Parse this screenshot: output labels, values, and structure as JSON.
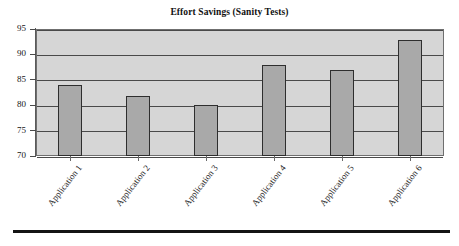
{
  "figure": {
    "background_color": "#ffffff",
    "plot_background_color": "#d6d6d6",
    "bar_color": "#a9a9a9",
    "bar_border_color": "#2e2e2e",
    "gridline_color": "#4a4a4a",
    "axis_color": "#5a5a5a",
    "rule_color": "#141414"
  },
  "chart_data": {
    "type": "bar",
    "title": "Effort Savings (Sanity Tests)",
    "xlabel": "",
    "ylabel": "",
    "categories": [
      "Application 1",
      "Application 2",
      "Application 3",
      "Application 4",
      "Application 5",
      "Application 6"
    ],
    "values": [
      84,
      81.8,
      80,
      88,
      87,
      92.8
    ],
    "ylim": [
      70,
      95
    ],
    "yticks": [
      70,
      75,
      80,
      85,
      90,
      95
    ],
    "ytick_labels": [
      "70",
      "75",
      "80",
      "85",
      "90",
      "95"
    ],
    "grid": true,
    "grid_axis": "y",
    "legend": null,
    "legend_position": "none",
    "orientation": "vertical"
  }
}
